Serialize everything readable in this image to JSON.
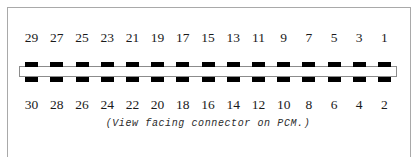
{
  "figure": {
    "kind": "connector-pinout-diagram",
    "caption": "(View facing connector on PCM.)",
    "connector": {
      "total_pins": 30,
      "columns": 15,
      "top_row_label": "odd pins",
      "bottom_row_label": "even pins",
      "top_row_pins": [
        29,
        27,
        25,
        23,
        21,
        19,
        17,
        15,
        13,
        11,
        9,
        7,
        5,
        3,
        1
      ],
      "bottom_row_pins": [
        30,
        28,
        26,
        24,
        22,
        20,
        18,
        16,
        14,
        12,
        10,
        8,
        6,
        4,
        2
      ]
    },
    "colors": {
      "pin_tab": "#000000",
      "shell_fill": "#ffffff",
      "shell_border": "#8c8c8c",
      "frame_border": "#a9a9a9",
      "label_text": "#1a1a1a",
      "caption_text": "#2b2b2b"
    }
  }
}
